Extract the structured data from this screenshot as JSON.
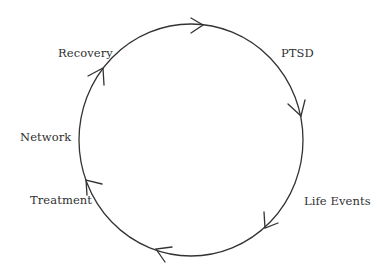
{
  "diagram": {
    "type": "cycle",
    "direction": "clockwise",
    "colors": {
      "stroke": "#333333",
      "text": "#2f2f2f",
      "background": "#ffffff"
    },
    "ring": {
      "cx": 191,
      "cy": 140,
      "rx": 112,
      "ry": 116
    },
    "nodes": [
      {
        "id": "ptsd",
        "label": "PTSD",
        "x": 281,
        "y": 57
      },
      {
        "id": "life-events",
        "label": "Life Events",
        "x": 304,
        "y": 205
      },
      {
        "id": "treatment",
        "label": "Treatment",
        "x": 30,
        "y": 204
      },
      {
        "id": "network",
        "label": "Network",
        "x": 20,
        "y": 141
      },
      {
        "id": "recovery",
        "label": "Recovery",
        "x": 58,
        "y": 57
      }
    ],
    "arrows": [
      {
        "name": "arrow-top",
        "tip": [
          203,
          25
        ],
        "wing1": [
          191,
          18
        ],
        "wing2": [
          191,
          33
        ]
      },
      {
        "name": "arrow-right-upper",
        "tip": [
          301,
          116
        ],
        "wing1": [
          288,
          104
        ],
        "wing2": [
          305,
          100
        ]
      },
      {
        "name": "arrow-lower-right",
        "tip": [
          265,
          228
        ],
        "wing1": [
          264,
          212
        ],
        "wing2": [
          278,
          223
        ]
      },
      {
        "name": "arrow-bottom",
        "tip": [
          156,
          249
        ],
        "wing1": [
          172,
          247
        ],
        "wing2": [
          165,
          262
        ]
      },
      {
        "name": "arrow-left",
        "tip": [
          86,
          180
        ],
        "wing1": [
          102,
          184
        ],
        "wing2": [
          87,
          195
        ]
      },
      {
        "name": "arrow-upper-left",
        "tip": [
          103,
          68
        ],
        "wing1": [
          88,
          76
        ],
        "wing2": [
          104,
          85
        ]
      }
    ]
  }
}
